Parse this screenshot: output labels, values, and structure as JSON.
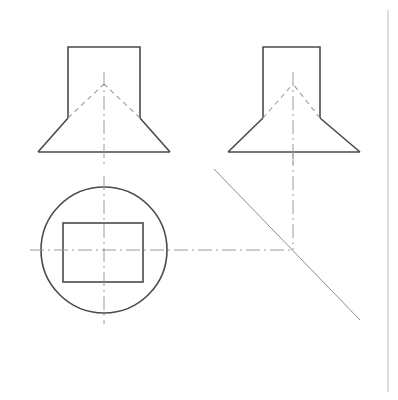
{
  "drawing": {
    "title": "Orthographic Projection - Cone on Square Prism",
    "canvas": {
      "width": 398,
      "height": 400,
      "background": "#ffffff"
    },
    "styles": {
      "visible_edge_color": "#4a4a4a",
      "visible_edge_width": 1.6,
      "hidden_edge_color": "#9a9a9a",
      "hidden_edge_width": 1.1,
      "hidden_edge_dash": "5,4",
      "center_line_color": "#9a9a9a",
      "center_line_width": 1.0,
      "center_line_dash": "14,4,2,4",
      "projection_line_color": "#b0b0b0",
      "projection_line_width": 1.0,
      "miter_line_color": "#8f8f8f",
      "miter_line_width": 1.0,
      "sheet_border_color": "#c8c8c8",
      "sheet_border_width": 1.2
    },
    "sheet_border": {
      "x": 388,
      "y1": 10,
      "y2": 392
    },
    "views": [
      {
        "name": "front-view",
        "label": "Front View",
        "prism": {
          "left": 68,
          "right": 140,
          "top": 47,
          "bottom": 118
        },
        "cone": {
          "apex_x": 104,
          "apex_y": 84,
          "base_left": 38,
          "base_right": 170,
          "base_y": 152
        },
        "cone_flank_start_left_x": 68,
        "cone_flank_start_left_y": 118,
        "cone_flank_start_right_x": 140,
        "cone_flank_start_right_y": 118,
        "hidden_apex_edges": [
          {
            "x1": 68,
            "y1": 118,
            "x2": 104,
            "y2": 84
          },
          {
            "x1": 140,
            "y1": 118,
            "x2": 104,
            "y2": 84
          }
        ],
        "vertical_center_line": {
          "x": 104,
          "y1": 72,
          "y2": 168
        }
      },
      {
        "name": "side-view",
        "label": "Side View",
        "prism": {
          "left": 263,
          "right": 320,
          "top": 47,
          "bottom": 118
        },
        "cone": {
          "apex_x": 293,
          "apex_y": 84,
          "base_left": 228,
          "base_right": 360,
          "base_y": 152
        },
        "hidden_apex_edges": [
          {
            "x1": 263,
            "y1": 118,
            "x2": 293,
            "y2": 84
          },
          {
            "x1": 320,
            "y1": 118,
            "x2": 293,
            "y2": 84
          }
        ],
        "vertical_center_line": {
          "x": 293,
          "y1": 72,
          "y2": 168
        }
      },
      {
        "name": "top-view",
        "label": "Top View",
        "circle": {
          "cx": 104,
          "cy": 250,
          "r": 63
        },
        "square": {
          "left": 63,
          "right": 143,
          "top": 223,
          "bottom": 282
        },
        "vertical_center_line": {
          "x": 104,
          "y1": 176,
          "y2": 324
        },
        "horizontal_center_line": {
          "y": 250,
          "x1": 30,
          "x2": 293
        }
      }
    ],
    "construction": {
      "miter_line": {
        "x1": 214,
        "y1": 169,
        "x2": 360,
        "y2": 320
      },
      "miter_corner": {
        "x": 293,
        "y": 250
      },
      "projection_vertical": {
        "x": 293,
        "y1": 152,
        "y2": 250
      },
      "projection_horizontal": {
        "y": 250,
        "x1": 167,
        "x2": 293
      }
    }
  }
}
